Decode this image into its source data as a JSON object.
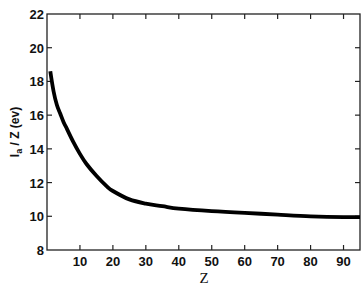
{
  "chart_data": {
    "type": "line",
    "title": "",
    "xlabel": "Z",
    "ylabel": "I_a / Z (ev)",
    "ylabel_parts": {
      "main": "I",
      "sub": "a",
      "rest": "/ Z (ev)"
    },
    "xlim": [
      0,
      95
    ],
    "ylim": [
      8,
      22
    ],
    "xticks": [
      10,
      20,
      30,
      40,
      50,
      60,
      70,
      80,
      90
    ],
    "yticks": [
      8,
      10,
      12,
      14,
      16,
      18,
      20,
      22
    ],
    "grid": false,
    "legend": null,
    "series": [
      {
        "name": "I_a/Z",
        "color": "#000000",
        "x": [
          1,
          2,
          3,
          4,
          5,
          6,
          8,
          10,
          12,
          15,
          18,
          20,
          25,
          30,
          35,
          40,
          50,
          60,
          70,
          80,
          90,
          95
        ],
        "y": [
          18.6,
          17.4,
          16.6,
          16.1,
          15.6,
          15.2,
          14.4,
          13.7,
          13.1,
          12.4,
          11.8,
          11.5,
          11.0,
          10.75,
          10.6,
          10.45,
          10.3,
          10.2,
          10.1,
          10.0,
          9.95,
          9.95
        ]
      }
    ]
  }
}
